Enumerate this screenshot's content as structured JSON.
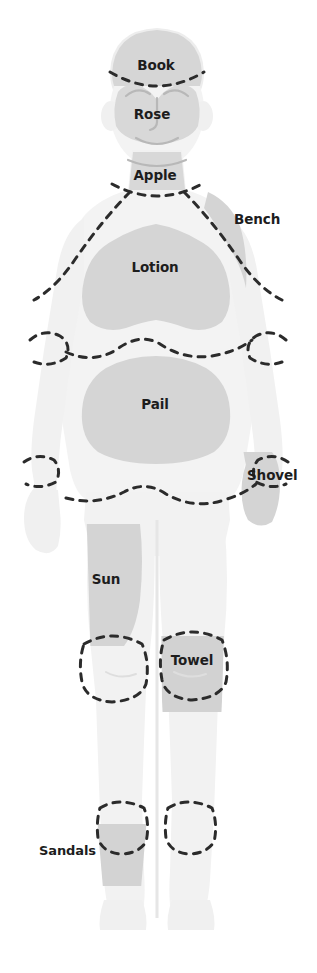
{
  "diagram": {
    "type": "body-map",
    "orientation": "front-facing full-body silhouette",
    "colors": {
      "background": "#ffffff",
      "body_fill": "#f3f3f3",
      "body_outline": "#ececec",
      "region_shade": "#d5d5d5",
      "region_shade_dark": "#cdcdcd",
      "feature_line": "#cfcfcf",
      "dash_line": "#2b2b2b",
      "label_text": "#1d1d1d"
    },
    "dash_style": {
      "stroke_width": 3,
      "dash_array": "7 7",
      "linecap": "round"
    },
    "regions": [
      {
        "id": "scalp",
        "label": "Book",
        "body_part": "head-top-scalp",
        "shaded": true,
        "label_x": 156,
        "label_y": 70,
        "anchor": "middle"
      },
      {
        "id": "face",
        "label": "Rose",
        "body_part": "face",
        "shaded": true,
        "label_x": 152,
        "label_y": 119,
        "anchor": "middle"
      },
      {
        "id": "neck",
        "label": "Apple",
        "body_part": "neck-throat",
        "shaded": true,
        "label_x": 155,
        "label_y": 180,
        "anchor": "middle"
      },
      {
        "id": "shoulder-right",
        "label": "Bench",
        "body_part": "right-shoulder",
        "shaded": true,
        "label_x": 234,
        "label_y": 224,
        "anchor": "start"
      },
      {
        "id": "chest",
        "label": "Lotion",
        "body_part": "chest-upper-torso",
        "shaded": true,
        "label_x": 155,
        "label_y": 272,
        "anchor": "middle"
      },
      {
        "id": "abdomen",
        "label": "Pail",
        "body_part": "abdomen-lower-torso",
        "shaded": true,
        "label_x": 155,
        "label_y": 409,
        "anchor": "middle"
      },
      {
        "id": "hand-right",
        "label": "Shovel",
        "body_part": "right-hand",
        "shaded": true,
        "label_x": 247,
        "label_y": 480,
        "anchor": "start"
      },
      {
        "id": "thigh-left",
        "label": "Sun",
        "body_part": "left-thigh",
        "shaded": true,
        "label_x": 106,
        "label_y": 584,
        "anchor": "middle"
      },
      {
        "id": "knee-right",
        "label": "Towel",
        "body_part": "right-knee",
        "shaded": true,
        "label_x": 192,
        "label_y": 665,
        "anchor": "middle"
      },
      {
        "id": "ankle-left",
        "label": "Sandals",
        "body_part": "left-ankle-foot",
        "shaded": true,
        "label_x": 96,
        "label_y": 855,
        "anchor": "end"
      }
    ]
  }
}
